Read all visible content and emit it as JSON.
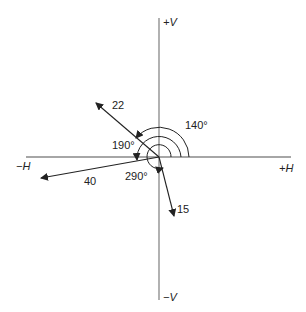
{
  "diagram": {
    "type": "phasor-diagram",
    "axes": {
      "positive_vertical": "+V",
      "negative_vertical": "−V",
      "positive_horizontal": "+H",
      "negative_horizontal": "−H"
    },
    "vectors": [
      {
        "magnitude_label": "22",
        "angle_deg": 140
      },
      {
        "magnitude_label": "40",
        "angle_deg": 190
      },
      {
        "magnitude_label": "15",
        "angle_deg": 290
      }
    ],
    "angle_labels": [
      "140°",
      "190°",
      "290°"
    ],
    "colors": {
      "axis": "#888888",
      "vector": "#222222",
      "text": "#222222"
    }
  }
}
